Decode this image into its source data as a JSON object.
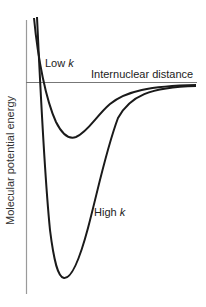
{
  "diagram": {
    "y_axis_label": "Molecular potential energy",
    "x_axis_label": "Internuclear distance",
    "curves": [
      {
        "name": "Low k",
        "label_text": "Low ",
        "label_var": "k",
        "color": "#1a1a1a"
      },
      {
        "name": "High k",
        "label_text": "High ",
        "label_var": "k",
        "color": "#1a1a1a"
      }
    ],
    "axis_color": "#888888"
  }
}
